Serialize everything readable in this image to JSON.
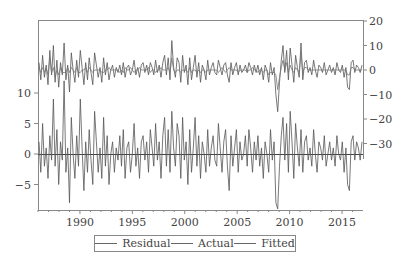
{
  "chart_data": {
    "type": "line",
    "title": "",
    "xlabel": "",
    "ylabel_left": "",
    "ylabel_right": "",
    "x_start": 1986.0,
    "x_end": 2017.0,
    "x_ticks": [
      1990,
      1995,
      2000,
      2005,
      2010,
      2015
    ],
    "left_axis": {
      "ticks": [
        -5,
        0,
        5,
        10
      ],
      "range": [
        -9.3,
        23
      ]
    },
    "right_axis": {
      "ticks": [
        -30,
        -20,
        -10,
        0,
        10,
        20
      ],
      "range": [
        -45,
        20
      ]
    },
    "grid": false,
    "legend_position": "bottom",
    "zero_line_left": true,
    "series": [
      {
        "name": "Residual",
        "axis": "left",
        "color": "#555555",
        "values": [
          2,
          -3,
          5,
          -2,
          1,
          -4,
          3,
          -1,
          9,
          -2,
          4,
          -5,
          2,
          -1,
          12,
          -3,
          1,
          -8,
          6,
          0,
          -4,
          3,
          -2,
          9,
          1,
          -6,
          2,
          -3,
          4,
          -1,
          -5,
          7,
          2,
          -3,
          1,
          -4,
          6,
          -2,
          3,
          -5,
          0,
          2,
          -3,
          1,
          -1,
          3,
          -2,
          4,
          -4,
          1,
          2,
          -3,
          0,
          5,
          -2,
          1,
          -4,
          2,
          3,
          -1,
          2,
          -3,
          4,
          1,
          -2,
          5,
          -1,
          2,
          -4,
          3,
          6,
          -2,
          4,
          -3,
          7,
          1,
          -2,
          5,
          3,
          -4,
          6,
          -1,
          2,
          -5,
          4,
          -3,
          1,
          6,
          -2,
          3,
          -4,
          2,
          0,
          -3,
          4,
          -2,
          1,
          3,
          -1,
          -2,
          5,
          1,
          -3,
          2,
          4,
          -2,
          -6,
          3,
          -2,
          1,
          4,
          -3,
          2,
          -1,
          0,
          3,
          -2,
          4,
          1,
          -3,
          2,
          -1,
          3,
          -2,
          1,
          -4,
          2,
          0,
          -3,
          4,
          -1,
          2,
          -8,
          -9,
          -2,
          3,
          6,
          -1,
          5,
          -3,
          7,
          2,
          -4,
          5,
          1,
          -2,
          4,
          -3,
          2,
          3,
          -1,
          1,
          -2,
          4,
          0,
          -3,
          2,
          1,
          -1,
          3,
          -2,
          0,
          2,
          -1,
          1,
          -2,
          3,
          0,
          -1,
          2,
          -3,
          1,
          -5,
          -6,
          2,
          3,
          -1,
          2,
          1,
          -1,
          2
        ]
      },
      {
        "name": "Actual",
        "axis": "right",
        "color": "#555555",
        "values": [
          3,
          -4,
          6,
          -3,
          2,
          -6,
          8,
          -2,
          10,
          -5,
          4,
          -7,
          3,
          -2,
          11,
          -4,
          2,
          -9,
          7,
          0,
          -5,
          4,
          -3,
          8,
          1,
          -6,
          3,
          -4,
          5,
          -1,
          -6,
          7,
          2,
          -3,
          1,
          -5,
          5,
          -2,
          3,
          -4,
          0,
          2,
          -3,
          1,
          -1,
          2,
          -2,
          3,
          -3,
          1,
          2,
          -2,
          0,
          4,
          -2,
          1,
          -3,
          2,
          3,
          -1,
          2,
          -2,
          3,
          1,
          -2,
          4,
          -1,
          2,
          -3,
          3,
          6,
          -2,
          5,
          -4,
          12,
          1,
          -3,
          5,
          3,
          -5,
          6,
          -1,
          2,
          -6,
          5,
          -4,
          1,
          6,
          -3,
          3,
          -5,
          2,
          0,
          -4,
          4,
          -2,
          1,
          3,
          -1,
          -2,
          4,
          1,
          -2,
          2,
          3,
          -2,
          -5,
          3,
          -2,
          1,
          3,
          -2,
          2,
          -1,
          0,
          2,
          -1,
          3,
          1,
          -2,
          2,
          -1,
          2,
          -2,
          1,
          -4,
          2,
          0,
          -5,
          3,
          -2,
          1,
          -10,
          -17,
          -5,
          4,
          10,
          -1,
          8,
          -4,
          9,
          2,
          -5,
          6,
          1,
          -3,
          11,
          -4,
          3,
          4,
          -1,
          1,
          -2,
          4,
          0,
          -3,
          2,
          1,
          -1,
          3,
          -2,
          0,
          2,
          -1,
          1,
          -2,
          3,
          0,
          -1,
          2,
          -3,
          1,
          -7,
          -8,
          3,
          4,
          -1,
          2,
          1,
          -1,
          2
        ]
      },
      {
        "name": "Fitted",
        "axis": "right",
        "color": "#777777",
        "values": [
          1,
          -1,
          1,
          -1,
          1,
          -2,
          5,
          -1,
          1,
          -3,
          0,
          -2,
          1,
          -1,
          -1,
          -1,
          1,
          -1,
          1,
          0,
          -1,
          1,
          -1,
          -1,
          0,
          0,
          1,
          -1,
          1,
          0,
          -1,
          0,
          0,
          0,
          0,
          -1,
          -1,
          0,
          0,
          1,
          0,
          0,
          0,
          0,
          0,
          -1,
          0,
          -1,
          1,
          0,
          0,
          1,
          0,
          -1,
          0,
          0,
          1,
          0,
          0,
          0,
          0,
          1,
          -1,
          0,
          0,
          -1,
          0,
          0,
          1,
          0,
          0,
          0,
          1,
          -1,
          5,
          0,
          -1,
          0,
          0,
          -1,
          0,
          0,
          0,
          -1,
          1,
          -1,
          0,
          0,
          -1,
          0,
          -1,
          0,
          0,
          -1,
          0,
          0,
          0,
          0,
          0,
          0,
          -1,
          0,
          1,
          0,
          -1,
          0,
          1,
          0,
          0,
          0,
          0,
          -1,
          0,
          0,
          0,
          0,
          -1,
          0,
          0,
          1,
          0,
          0,
          -1,
          0,
          0,
          -1,
          0,
          0,
          -2,
          -1,
          -1,
          -1,
          -2,
          -8,
          -3,
          1,
          4,
          0,
          3,
          -1,
          2,
          0,
          -1,
          1,
          0,
          -1,
          7,
          -1,
          1,
          1,
          0,
          0,
          0,
          0,
          0,
          0,
          0,
          0,
          0,
          0,
          0,
          0,
          0,
          0,
          0,
          0,
          0,
          0,
          0,
          0,
          0,
          0,
          -2,
          -2,
          1,
          1,
          0,
          0,
          0,
          0,
          0
        ]
      }
    ]
  },
  "axes": {
    "left_ticks": [
      "10",
      "5",
      "0",
      "−5"
    ],
    "right_ticks": [
      "20",
      "10",
      "0",
      "−10",
      "−20",
      "−30"
    ],
    "x_ticks": [
      "1990",
      "1995",
      "2000",
      "2005",
      "2010",
      "2015"
    ]
  },
  "legend": {
    "items": [
      {
        "label": "Residual"
      },
      {
        "label": "Actual"
      },
      {
        "label": "Fitted"
      }
    ]
  }
}
